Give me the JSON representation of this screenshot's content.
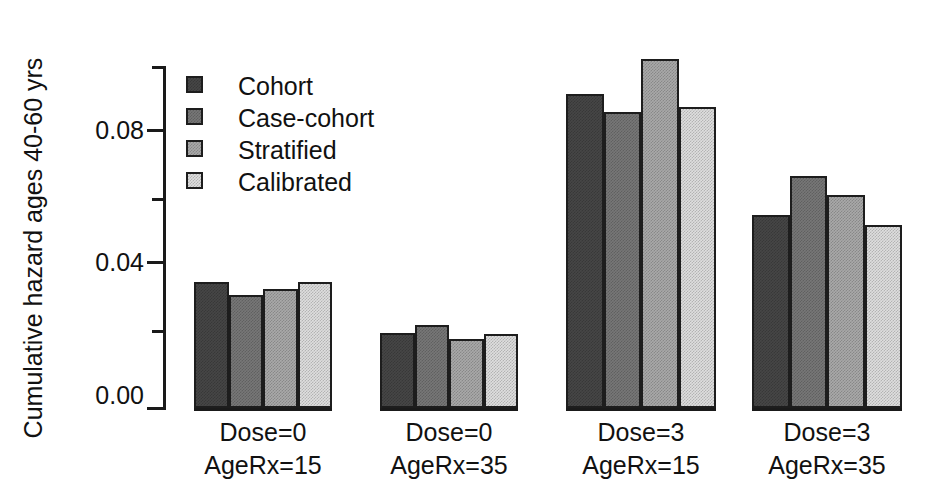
{
  "chart_data": {
    "type": "bar",
    "title": "",
    "xlabel": "",
    "ylabel": "Cumulative hazard ages 40-60 yrs",
    "ylim": [
      0,
      0.0984
    ],
    "grid": false,
    "legend_position": "top-left",
    "ytick_labels": [
      "0.00",
      "0.04",
      "0.08"
    ],
    "ytick_values": [
      0.0,
      0.04,
      0.08
    ],
    "yminor_tick_values": [
      0.02,
      0.06
    ],
    "categories": [
      "Dose=0 AgeRx=15",
      "Dose=0 AgeRx=35",
      "Dose=3 AgeRx=15",
      "Dose=3 AgeRx=35"
    ],
    "category_lines": [
      [
        "Dose=0",
        "AgeRx=15"
      ],
      [
        "Dose=0",
        "AgeRx=35"
      ],
      [
        "Dose=3",
        "AgeRx=15"
      ],
      [
        "Dose=3",
        "AgeRx=35"
      ]
    ],
    "series": [
      {
        "name": "Cohort",
        "color": "#464646",
        "values": [
          0.036,
          0.0216,
          0.0901,
          0.0553
        ]
      },
      {
        "name": "Case-cohort",
        "color": "#777777",
        "values": [
          0.0325,
          0.0239,
          0.0849,
          0.0665
        ]
      },
      {
        "name": "Stratified",
        "color": "#a9a9a9",
        "values": [
          0.034,
          0.0199,
          0.1002,
          0.061
        ]
      },
      {
        "name": "Calibrated",
        "color": "#dedede",
        "values": [
          0.036,
          0.0213,
          0.0864,
          0.0524
        ]
      }
    ]
  },
  "legend": {
    "items": [
      {
        "label": "Cohort",
        "swatch": "legend-swatch-cohort"
      },
      {
        "label": "Case-cohort",
        "swatch": "legend-swatch-case-cohort"
      },
      {
        "label": "Stratified",
        "swatch": "legend-swatch-stratified"
      },
      {
        "label": "Calibrated",
        "swatch": "legend-swatch-calibrated"
      }
    ]
  },
  "axis": {
    "y_title": "Cumulative hazard ages 40-60 yrs",
    "y_labels": [
      "0.08",
      "0.04",
      "0.00"
    ]
  }
}
